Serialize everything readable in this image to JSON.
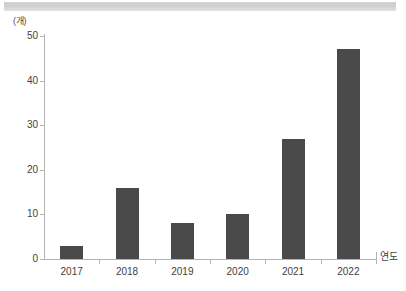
{
  "chart_data": {
    "type": "bar",
    "title": "",
    "subtitle": "",
    "categories": [
      "2017",
      "2018",
      "2019",
      "2020",
      "2021",
      "2022"
    ],
    "values": [
      3,
      16,
      8,
      10,
      27,
      47
    ],
    "xlabel": "연도",
    "ylabel": "(개)",
    "ylim": [
      0,
      50
    ],
    "y_ticks": [
      0,
      10,
      20,
      30,
      40,
      50
    ],
    "grid": false,
    "legend": null,
    "bar_color": "#4a4a4a",
    "axis_color": "#b5b5b5"
  },
  "decor": {
    "top_band_color": "#d2d2d2"
  }
}
